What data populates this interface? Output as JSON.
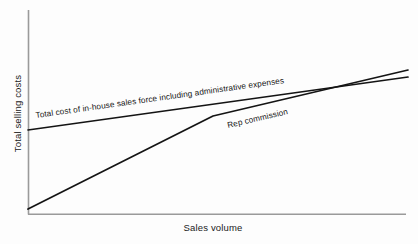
{
  "chart_data": {
    "type": "line",
    "title": "",
    "subtitle": "",
    "xlabel": "Sales volume",
    "ylabel": "Total selling costs",
    "grid": false,
    "legend_position": "inline-annotations",
    "axis": {
      "x_range_label": "Sales volume (no numeric ticks)",
      "y_range_label": "Total selling costs (no numeric ticks)",
      "x_ticks": [],
      "y_ticks": [],
      "xlim": [
        0,
        100
      ],
      "ylim": [
        0,
        100
      ]
    },
    "series": [
      {
        "name": "Total cost of in-house sales force including administrative expenses",
        "label": "Total cost of in-house sales force including administrative expenses",
        "shape": "straight-line-high-intercept-shallow-slope",
        "x": [
          0,
          100
        ],
        "values": [
          39,
          65
        ],
        "points_px": [
          [
            28,
            130
          ],
          [
            408,
            77
          ]
        ]
      },
      {
        "name": "Rep commission",
        "label": "Rep commission",
        "shape": "two-segment-kinked-line-from-origin",
        "x": [
          0,
          48.7,
          100
        ],
        "values": [
          2,
          47,
          69
        ],
        "points_px": [
          [
            28,
            209
          ],
          [
            213,
            116
          ],
          [
            408,
            70
          ]
        ]
      }
    ],
    "annotations": [
      {
        "text": "Total cost of in-house sales force including administrative expenses",
        "for_series": "Total cost of in-house sales force including administrative expenses",
        "rotation_deg": -8,
        "anchor_px": [
          36,
          118
        ]
      },
      {
        "text": "Rep commission",
        "for_series": "Rep commission",
        "rotation_deg": -13,
        "anchor_px": [
          228,
          128
        ]
      }
    ],
    "crossing_point_px": [
      327,
      86
    ],
    "colors": {
      "line": "#141414",
      "axis": "#9a9a9a",
      "text": "#1a1a1a",
      "background": "#fdfdfd"
    }
  },
  "axes": {
    "y_title": "Total selling costs",
    "x_title": "Sales volume"
  },
  "labels": {
    "inhouse": "Total cost of in-house sales force including administrative expenses",
    "rep": "Rep commission"
  }
}
